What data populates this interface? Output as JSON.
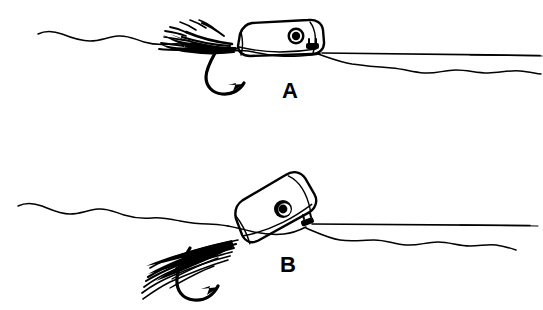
{
  "figure": {
    "background_color": "#ffffff",
    "ink_color": "#000000",
    "width": 543,
    "height": 310,
    "style": "black and white pen-and-ink line drawing"
  },
  "panels": [
    {
      "id": "panel-a",
      "label": "A",
      "label_x": 290,
      "label_y": 98,
      "description": "Popper riding flat and high on the surface, face nearly level, body mostly above the waterline",
      "popper": {
        "name": "popper-body",
        "orientation": "level",
        "tilt_degrees": -4,
        "face": "flat sloped face at left",
        "eye": {
          "name": "popper-eye",
          "cx": 296,
          "cy": 36,
          "outer_radius": 8.5,
          "ring_radius": 6.0,
          "pupil_radius": 4.2,
          "outer_color": "#000000",
          "ring_color": "#ffffff",
          "pupil_color": "#000000"
        },
        "tail_tab": {
          "name": "line-tie-tab",
          "x": 313,
          "y": 46
        }
      },
      "hook": {
        "name": "hook",
        "shape": "j-hook with barb",
        "point_direction": "up-right"
      },
      "hackle": {
        "name": "hackle-collar",
        "style": "dense bushy clump",
        "fiber_count": 13
      }
    },
    {
      "id": "panel-b",
      "label": "B",
      "label_x": 288,
      "label_y": 272,
      "description": "Popper cocked nose-up at a steep angle, tail end buried deeper, body sitting lower in the water",
      "popper": {
        "name": "popper-body",
        "orientation": "tilted nose-up",
        "tilt_degrees": -27,
        "face": "flat sloped face at left, angled down into water",
        "eye": {
          "name": "popper-eye",
          "cx": 283,
          "cy": 209,
          "outer_radius": 9.0,
          "ring_radius": 6.2,
          "pupil_radius": 4.4,
          "outer_color": "#000000",
          "ring_color": "#ffffff",
          "pupil_color": "#000000"
        },
        "tail_tab": {
          "name": "line-tie-tab",
          "x": 307,
          "y": 206
        }
      },
      "hook": {
        "name": "hook",
        "shape": "j-hook with barb",
        "point_direction": "up-right"
      },
      "hackle": {
        "name": "hackle-collar",
        "style": "long raked individual strands",
        "fiber_count": 16
      }
    }
  ],
  "water": {
    "name": "water-surface",
    "panel_a": {
      "left_wave_label": "wavy surface left of popper",
      "right_wave_label": "wavy surface right of popper",
      "leader_label": "straight leader line trailing to the right"
    },
    "panel_b": {
      "left_wave_label": "wavy surface left of popper",
      "right_wave_label": "wavy surface right of popper",
      "leader_label": "straight leader line trailing to the right"
    }
  }
}
